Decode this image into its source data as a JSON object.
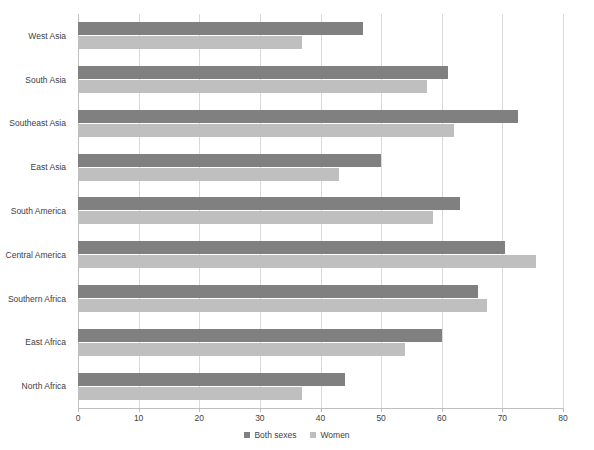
{
  "title_remnant": "",
  "legend": {
    "position": "bottom-center",
    "items": [
      {
        "label": "Both sexes",
        "color": "#808080",
        "key": "both_sexes"
      },
      {
        "label": "Women",
        "color": "#bfbfbf",
        "key": "women"
      }
    ]
  },
  "axis": {
    "x_ticks": [
      0,
      10,
      20,
      30,
      40,
      50,
      60,
      70,
      80
    ],
    "x_tick_labels": [
      "0",
      "10",
      "20",
      "30",
      "40",
      "50",
      "60",
      "70",
      "80"
    ],
    "xmin": 0,
    "xmax": 80,
    "grid": true
  },
  "chart_data": {
    "type": "bar",
    "orientation": "horizontal",
    "title": "",
    "xlabel": "",
    "ylabel": "",
    "xlim": [
      0,
      80
    ],
    "grid": true,
    "legend_position": "bottom-center",
    "categories": [
      "West Asia",
      "South Asia",
      "Southeast Asia",
      "East Asia",
      "South America",
      "Central America",
      "Southern Africa",
      "East Africa",
      "North Africa"
    ],
    "series": [
      {
        "name": "Both sexes",
        "color": "#808080",
        "values": [
          47,
          61,
          72.5,
          50,
          63,
          70.5,
          66,
          60,
          44
        ]
      },
      {
        "name": "Women",
        "color": "#bfbfbf",
        "values": [
          37,
          57.5,
          62,
          43,
          58.5,
          75.5,
          67.5,
          54,
          37
        ]
      }
    ]
  }
}
